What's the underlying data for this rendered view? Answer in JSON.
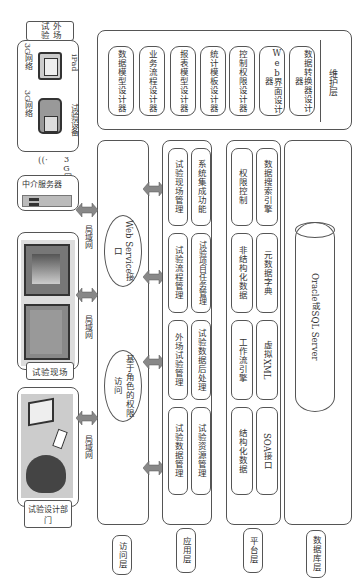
{
  "diagram": {
    "orientation": "rotated-90-clockwise",
    "layers": {
      "access": "访问层",
      "application": "应用层",
      "platform": "平台层",
      "database": "数据库层",
      "maintenance": "维护层"
    },
    "clients": {
      "field_test": {
        "title": "外场试验",
        "devices": [
          "试验设备",
          "iPad"
        ],
        "network_labels": [
          "3G网络",
          "3G网络"
        ]
      },
      "middle_server": {
        "title": "中介服务器",
        "network": "3G网络"
      },
      "test_site": {
        "title": "试验现场"
      },
      "design_dept": {
        "title": "试验设计部门"
      },
      "lan_labels": [
        "局域网",
        "局域网",
        "局域网"
      ]
    },
    "access_layer": {
      "items": [
        "Web Service接口",
        "基于角色的权限访问"
      ]
    },
    "application_layer": {
      "row1": [
        "试验现场管理",
        "试验流程管理",
        "外场试验管理",
        "试验数据管理"
      ],
      "row2": [
        "系统集成功能",
        "试验项目任务管理",
        "试验数据后处理",
        "试验资源管理"
      ]
    },
    "platform_layer": {
      "row1": [
        "权限控制",
        "非结构化数据",
        "工作流引擎",
        "结构化数据"
      ],
      "row2": [
        "数据搜索引擎",
        "元数据字典",
        "虚拟XML",
        "SOA接口"
      ]
    },
    "database_layer": {
      "db": "Oracle或SQL Server"
    },
    "maintenance_layer": {
      "designers": [
        "数据模型设计器",
        "业务流程设计器",
        "报表模型设计器",
        "统计模板设计器",
        "控制权限设计器",
        "Web界面设计器",
        "数据转换器设计器"
      ]
    }
  }
}
